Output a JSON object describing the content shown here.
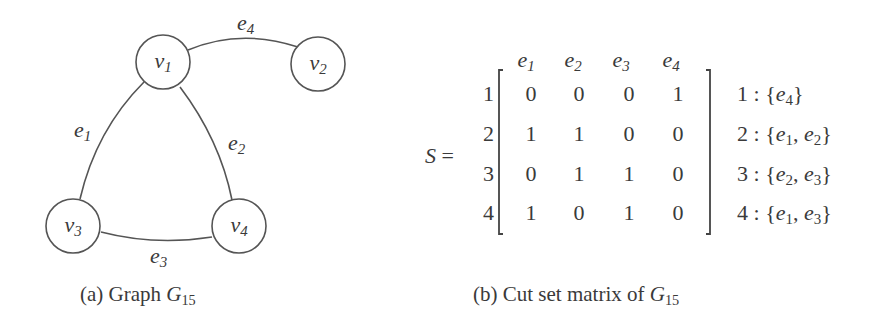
{
  "graph": {
    "nodes": [
      {
        "id": "v1",
        "base": "v",
        "sub": "1",
        "x": 163,
        "y": 62
      },
      {
        "id": "v2",
        "base": "v",
        "sub": "2",
        "x": 318,
        "y": 64
      },
      {
        "id": "v3",
        "base": "v",
        "sub": "3",
        "x": 73,
        "y": 226
      },
      {
        "id": "v4",
        "base": "v",
        "sub": "4",
        "x": 239,
        "y": 226
      }
    ],
    "edges": [
      {
        "id": "e1",
        "base": "e",
        "sub": "1",
        "from": "v1",
        "to": "v3"
      },
      {
        "id": "e2",
        "base": "e",
        "sub": "2",
        "from": "v1",
        "to": "v4"
      },
      {
        "id": "e3",
        "base": "e",
        "sub": "3",
        "from": "v3",
        "to": "v4"
      },
      {
        "id": "e4",
        "base": "e",
        "sub": "4",
        "from": "v1",
        "to": "v2"
      }
    ],
    "caption": {
      "prefix": "(a) Graph ",
      "symbol": "G",
      "sub": "15"
    }
  },
  "matrix": {
    "name": "S",
    "equals": "=",
    "column_headers": [
      {
        "base": "e",
        "sub": "1"
      },
      {
        "base": "e",
        "sub": "2"
      },
      {
        "base": "e",
        "sub": "3"
      },
      {
        "base": "e",
        "sub": "4"
      }
    ],
    "row_labels": [
      "1",
      "2",
      "3",
      "4"
    ],
    "rows": [
      [
        "0",
        "0",
        "0",
        "1"
      ],
      [
        "1",
        "1",
        "0",
        "0"
      ],
      [
        "0",
        "1",
        "1",
        "0"
      ],
      [
        "1",
        "0",
        "1",
        "0"
      ]
    ],
    "cut_sets": [
      {
        "index": "1",
        "sep": " : ",
        "edges": [
          {
            "base": "e",
            "sub": "4"
          }
        ]
      },
      {
        "index": "2",
        "sep": " : ",
        "edges": [
          {
            "base": "e",
            "sub": "1"
          },
          {
            "base": "e",
            "sub": "2"
          }
        ]
      },
      {
        "index": "3",
        "sep": " : ",
        "edges": [
          {
            "base": "e",
            "sub": "2"
          },
          {
            "base": "e",
            "sub": "3"
          }
        ]
      },
      {
        "index": "4",
        "sep": " : ",
        "edges": [
          {
            "base": "e",
            "sub": "1"
          },
          {
            "base": "e",
            "sub": "3"
          }
        ]
      }
    ],
    "caption": {
      "prefix": "(b) Cut set matrix of ",
      "symbol": "G",
      "sub": "15"
    }
  }
}
